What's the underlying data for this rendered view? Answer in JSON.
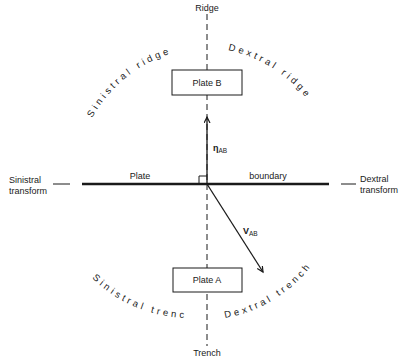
{
  "diagram": {
    "axis_labels": {
      "top": "Ridge",
      "bottom": "Trench"
    },
    "plates": {
      "upper": "Plate B",
      "lower": "Plate A"
    },
    "boundary": {
      "left_word": "Plate",
      "right_word": "boundary"
    },
    "side_labels": {
      "left_line1": "Sinistral",
      "left_line2": "transform",
      "right_line1": "Dextral",
      "right_line2": "transform"
    },
    "arc_labels": {
      "upper_left": "Sinistral ridge",
      "upper_right": "Dextral ridge",
      "lower_left": "Sinistral trench",
      "lower_right": "Dextral trench"
    },
    "vectors": {
      "normal": {
        "symbol": "η",
        "subscript": "AB"
      },
      "relative_velocity": {
        "symbol": "V",
        "subscript": "AB"
      }
    },
    "colors": {
      "ink": "#1a1a1a",
      "background": "#ffffff"
    }
  }
}
